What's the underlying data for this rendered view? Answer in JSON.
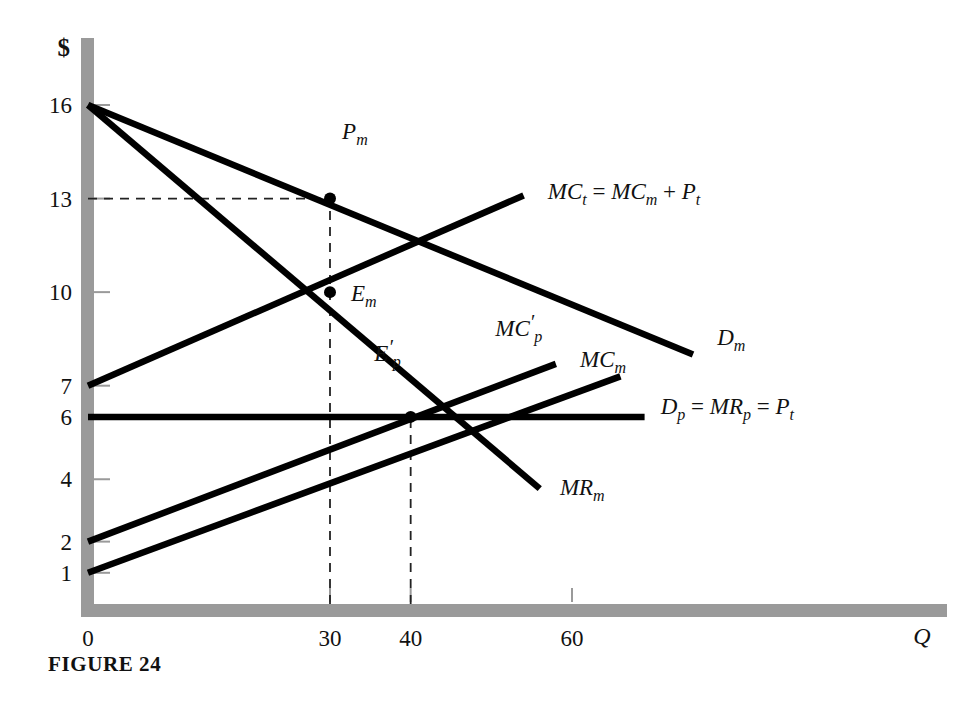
{
  "figure": {
    "caption": "FIGURE 24",
    "y_axis_title": "$",
    "x_axis_title": "Q"
  },
  "chart_data": {
    "type": "line",
    "title": "FIGURE 24",
    "xlabel": "Q",
    "ylabel": "$",
    "xlim": [
      0,
      100
    ],
    "ylim": [
      0,
      17.5
    ],
    "grid": false,
    "legend": "inline-curve-labels",
    "x_ticks": [
      0,
      30,
      40,
      60
    ],
    "x_tick_labels": [
      "0",
      "30",
      "40",
      "60"
    ],
    "y_ticks": [
      1,
      2,
      4,
      6,
      7,
      10,
      13,
      16
    ],
    "y_tick_labels": [
      "1",
      "2",
      "4",
      "6",
      "7",
      "10",
      "13",
      "16"
    ],
    "series": [
      {
        "name": "D_m",
        "label": "D_m",
        "label_parts": {
          "base": "D",
          "sub": "m"
        },
        "points": [
          [
            0,
            16
          ],
          [
            75,
            8
          ]
        ],
        "label_x": 78,
        "label_y": 8.3
      },
      {
        "name": "MR_m",
        "label": "MR_m",
        "label_parts": {
          "base": "MR",
          "sub": "m"
        },
        "points": [
          [
            0,
            16
          ],
          [
            56,
            3.7
          ]
        ],
        "label_x": 58.5,
        "label_y": 3.5
      },
      {
        "name": "MC_t",
        "label": "MC_t = MC_m + P_t",
        "label_parts": {
          "base1": "MC",
          "sub1": "t",
          "op1": "=",
          "base2": "MC",
          "sub2": "m",
          "op2": "+",
          "base3": "P",
          "sub3": "t"
        },
        "points": [
          [
            0,
            7
          ],
          [
            54,
            13.1
          ]
        ],
        "label_x": 57,
        "label_y": 13.0
      },
      {
        "name": "MC_p_prime",
        "label": "MC'_p",
        "label_parts": {
          "base": "MC",
          "prime": "′",
          "sub": "p"
        },
        "points": [
          [
            0,
            2
          ],
          [
            58,
            7.7
          ]
        ],
        "label_x": 50.5,
        "label_y": 8.6
      },
      {
        "name": "MC_m",
        "label": "MC_m",
        "label_parts": {
          "base": "MC",
          "sub": "m"
        },
        "points": [
          [
            0,
            1
          ],
          [
            66,
            7.3
          ]
        ],
        "label_x": 61,
        "label_y": 7.6
      },
      {
        "name": "D_p",
        "label": "D_p = MR_p = P_t",
        "label_parts": {
          "base1": "D",
          "sub1": "p",
          "op1": "=",
          "base2": "MR",
          "sub2": "p",
          "op2": "=",
          "base3": "P",
          "sub3": "t"
        },
        "points": [
          [
            0,
            6
          ],
          [
            69,
            6
          ]
        ],
        "label_x": 71,
        "label_y": 6.1
      }
    ],
    "annotations": [
      {
        "name": "P_m",
        "label": "P_m",
        "label_parts": {
          "base": "P",
          "sub": "m"
        },
        "x": 30,
        "y": 13,
        "label_dx": 1.5,
        "label_dy": 1.9,
        "marker": true
      },
      {
        "name": "E_m",
        "label": "E_m",
        "label_parts": {
          "base": "E",
          "sub": "m"
        },
        "x": 30,
        "y": 10,
        "label_dx": 2.6,
        "label_dy": -0.3,
        "marker": true
      },
      {
        "name": "E_p_prime",
        "label": "E'_p",
        "label_parts": {
          "base": "E",
          "prime": "′",
          "sub": "p"
        },
        "x": 40,
        "y": 6,
        "label_dx": -4.5,
        "label_dy": 1.8,
        "marker": true
      }
    ],
    "guides": [
      {
        "name": "price-guide-horizontal",
        "type": "horizontal",
        "y": 13,
        "from_x": 0,
        "to_x": 30
      },
      {
        "name": "monopoly-quantity-guide",
        "type": "vertical",
        "x": 30,
        "from_y": 0,
        "to_y": 13
      },
      {
        "name": "competitive-quantity-guide",
        "type": "vertical",
        "x": 40,
        "from_y": 0,
        "to_y": 6
      }
    ]
  }
}
